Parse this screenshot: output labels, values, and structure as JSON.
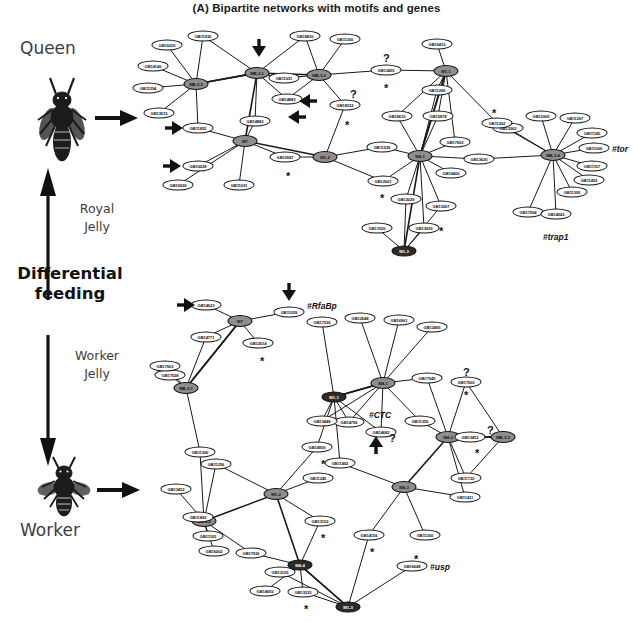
{
  "figure": {
    "title": "(A) Bipartite networks with motifs and genes",
    "left_labels": {
      "queen": "Queen",
      "worker": "Worker",
      "royal_jelly": "Royal\nJelly",
      "royal_jelly_line1": "Royal",
      "royal_jelly_line2": "Jelly",
      "worker_jelly_line1": "Worker",
      "worker_jelly_line2": "Jelly",
      "differential_feeding_line1": "Differential",
      "differential_feeding_line2": "feeding"
    },
    "symbols": {
      "question": "?",
      "star": "*",
      "hash": "#"
    },
    "colors": {
      "motif_fill": "#8e8e8e",
      "motif_dark_fill": "#2b2b2b",
      "gene_fill": "#ffffff",
      "stroke": "#111111",
      "label_gray": "#3d3d3d"
    }
  },
  "queen_network": {
    "name": "Queen bipartite network",
    "motifs": [
      {
        "id": "qm1",
        "label": "MB-3-2",
        "x": 196,
        "y": 84,
        "kind": "motif"
      },
      {
        "id": "qm2",
        "label": "MB-3-1",
        "x": 257,
        "y": 73,
        "kind": "motif"
      },
      {
        "id": "qm3",
        "label": "M7",
        "x": 245,
        "y": 141,
        "kind": "motif"
      },
      {
        "id": "qm4",
        "label": "MB-3-3",
        "x": 319,
        "y": 75,
        "kind": "motif"
      },
      {
        "id": "qm5",
        "label": "M1-1",
        "x": 446,
        "y": 71,
        "kind": "motif"
      },
      {
        "id": "qm6",
        "label": "M1-2",
        "x": 325,
        "y": 157,
        "kind": "motif"
      },
      {
        "id": "qm7",
        "label": "M4-1",
        "x": 420,
        "y": 156,
        "kind": "motif"
      },
      {
        "id": "qm8",
        "label": "MB-3-4",
        "x": 553,
        "y": 155,
        "kind": "motif"
      },
      {
        "id": "qm9",
        "label": "M1-3",
        "x": 404,
        "y": 251,
        "kind": "motif-dark"
      }
    ],
    "genes": [
      {
        "id": "qg1",
        "label": "GB11930",
        "x": 203,
        "y": 36
      },
      {
        "id": "qg2",
        "label": "GB16205",
        "x": 167,
        "y": 45
      },
      {
        "id": "qg3",
        "label": "GB14140",
        "x": 153,
        "y": 66
      },
      {
        "id": "qg4",
        "label": "GB11294",
        "x": 148,
        "y": 88
      },
      {
        "id": "qg5",
        "label": "GB13515",
        "x": 159,
        "y": 113
      },
      {
        "id": "qg6",
        "label": "GB11852",
        "x": 198,
        "y": 128
      },
      {
        "id": "qg7",
        "label": "GB10028",
        "x": 198,
        "y": 166
      },
      {
        "id": "qg8",
        "label": "GB16936",
        "x": 178,
        "y": 185
      },
      {
        "id": "qg9",
        "label": "GB11031",
        "x": 239,
        "y": 185
      },
      {
        "id": "qg10",
        "label": "GB11021",
        "x": 284,
        "y": 78
      },
      {
        "id": "qg11",
        "label": "GB14883",
        "x": 287,
        "y": 99
      },
      {
        "id": "qg12",
        "label": "GB14883",
        "x": 255,
        "y": 121
      },
      {
        "id": "qg13",
        "label": "GB18830",
        "x": 305,
        "y": 36
      },
      {
        "id": "qg14",
        "label": "GB11200",
        "x": 345,
        "y": 39
      },
      {
        "id": "qg15",
        "label": "GB13455",
        "x": 386,
        "y": 70
      },
      {
        "id": "qg16",
        "label": "GB18332",
        "x": 345,
        "y": 105
      },
      {
        "id": "qg17",
        "label": "GB10587",
        "x": 285,
        "y": 157
      },
      {
        "id": "qg18",
        "label": "GB16410",
        "x": 437,
        "y": 44
      },
      {
        "id": "qg19",
        "label": "GB11269",
        "x": 437,
        "y": 90
      },
      {
        "id": "qg20",
        "label": "GB18610",
        "x": 397,
        "y": 116
      },
      {
        "id": "qg21",
        "label": "GB15878",
        "x": 438,
        "y": 116
      },
      {
        "id": "qg22",
        "label": "GB11529",
        "x": 382,
        "y": 147
      },
      {
        "id": "qg23",
        "label": "GB12001",
        "x": 383,
        "y": 181
      },
      {
        "id": "qg24",
        "label": "GB17902",
        "x": 455,
        "y": 142
      },
      {
        "id": "qg25",
        "label": "GB19400",
        "x": 451,
        "y": 173
      },
      {
        "id": "qg26",
        "label": "GB13620",
        "x": 479,
        "y": 159
      },
      {
        "id": "qg27",
        "label": "GB13029",
        "x": 406,
        "y": 199
      },
      {
        "id": "qg28",
        "label": "GB13267",
        "x": 441,
        "y": 206
      },
      {
        "id": "qg29",
        "label": "GB17650",
        "x": 377,
        "y": 228
      },
      {
        "id": "qg30",
        "label": "GB13929",
        "x": 424,
        "y": 228
      },
      {
        "id": "qg31",
        "label": "GB13362",
        "x": 508,
        "y": 128
      },
      {
        "id": "qg32",
        "label": "GB12365",
        "x": 541,
        "y": 116
      },
      {
        "id": "qg33",
        "label": "GB11267",
        "x": 575,
        "y": 118
      },
      {
        "id": "qg34",
        "label": "GB11145",
        "x": 592,
        "y": 133
      },
      {
        "id": "qg35",
        "label": "GB11000",
        "x": 594,
        "y": 148,
        "annotation": "#tor"
      },
      {
        "id": "qg36",
        "label": "GB11157",
        "x": 592,
        "y": 166
      },
      {
        "id": "qg37",
        "label": "GB11403",
        "x": 589,
        "y": 180
      },
      {
        "id": "qg38",
        "label": "GB11393",
        "x": 572,
        "y": 192
      },
      {
        "id": "qg39",
        "label": "GB17994",
        "x": 528,
        "y": 212
      },
      {
        "id": "qg40",
        "label": "GB14543",
        "x": 556,
        "y": 214,
        "annotation": "#trap1"
      },
      {
        "id": "qg41",
        "label": "GB11262",
        "x": 497,
        "y": 123
      }
    ],
    "annotations": [
      {
        "text": "#tor",
        "x": 612,
        "y": 144
      },
      {
        "text": "#trap1",
        "x": 543,
        "y": 232
      }
    ],
    "question_marks": [
      {
        "x": 383,
        "y": 52
      },
      {
        "x": 350,
        "y": 88
      }
    ],
    "stars": [
      {
        "x": 384,
        "y": 85
      },
      {
        "x": 345,
        "y": 122
      },
      {
        "x": 286,
        "y": 173
      },
      {
        "x": 380,
        "y": 195
      },
      {
        "x": 492,
        "y": 110
      },
      {
        "x": 439,
        "y": 228
      }
    ],
    "arrows": [
      {
        "dir": "down",
        "x": 259,
        "y": 48
      },
      {
        "dir": "left",
        "x": 308,
        "y": 101
      },
      {
        "dir": "left",
        "x": 297,
        "y": 117
      },
      {
        "dir": "right",
        "x": 174,
        "y": 128
      },
      {
        "dir": "right",
        "x": 172,
        "y": 166
      }
    ]
  },
  "worker_network": {
    "name": "Worker bipartite network",
    "motifs": [
      {
        "id": "wm1",
        "label": "M7",
        "x": 240,
        "y": 321,
        "kind": "motif"
      },
      {
        "id": "wm2",
        "label": "MB-3-1",
        "x": 186,
        "y": 388,
        "kind": "motif"
      },
      {
        "id": "wm3",
        "label": "M4-1",
        "x": 383,
        "y": 383,
        "kind": "motif"
      },
      {
        "id": "wm4",
        "label": "M1-2",
        "x": 276,
        "y": 494,
        "kind": "motif"
      },
      {
        "id": "wm5",
        "label": "MB-3-2",
        "x": 204,
        "y": 521,
        "kind": "motif"
      },
      {
        "id": "wm6",
        "label": "M4-3",
        "x": 404,
        "y": 487,
        "kind": "motif"
      },
      {
        "id": "wm7",
        "label": "M4-2",
        "x": 448,
        "y": 437,
        "kind": "motif"
      },
      {
        "id": "wm8",
        "label": "MB-3-3",
        "x": 503,
        "y": 437,
        "kind": "motif"
      },
      {
        "id": "wm9",
        "label": "M1-1",
        "x": 334,
        "y": 397,
        "kind": "motif-dark"
      },
      {
        "id": "wm10",
        "label": "M1-3",
        "x": 348,
        "y": 607,
        "kind": "motif-dark"
      },
      {
        "id": "wm11",
        "label": "M4-4",
        "x": 300,
        "y": 565,
        "kind": "motif-dark"
      }
    ],
    "genes": [
      {
        "id": "wg1",
        "label": "GB14623",
        "x": 206,
        "y": 305
      },
      {
        "id": "wg2",
        "label": "GB14771",
        "x": 206,
        "y": 337
      },
      {
        "id": "wg3",
        "label": "GB11059",
        "x": 289,
        "y": 312,
        "annotation": "#RfaBp"
      },
      {
        "id": "wg4",
        "label": "GB12014",
        "x": 258,
        "y": 343
      },
      {
        "id": "wg5",
        "label": "GB17928",
        "x": 170,
        "y": 375
      },
      {
        "id": "wg6",
        "label": "GB17236",
        "x": 322,
        "y": 322
      },
      {
        "id": "wg7",
        "label": "GB12648",
        "x": 360,
        "y": 318
      },
      {
        "id": "wg8",
        "label": "GB16961",
        "x": 399,
        "y": 320
      },
      {
        "id": "wg9",
        "label": "GB12495",
        "x": 432,
        "y": 327
      },
      {
        "id": "wg10",
        "label": "GB17945",
        "x": 427,
        "y": 378
      },
      {
        "id": "wg11",
        "label": "GB17902",
        "x": 466,
        "y": 382
      },
      {
        "id": "wg12",
        "label": "GB14796",
        "x": 349,
        "y": 422,
        "annotation": "#CTC"
      },
      {
        "id": "wg13",
        "label": "GB14682",
        "x": 381,
        "y": 432
      },
      {
        "id": "wg14",
        "label": "GB11359",
        "x": 420,
        "y": 421
      },
      {
        "id": "wg15",
        "label": "GB13452",
        "x": 470,
        "y": 437
      },
      {
        "id": "wg16",
        "label": "GB11360",
        "x": 200,
        "y": 452
      },
      {
        "id": "wg17",
        "label": "GB11256",
        "x": 216,
        "y": 464
      },
      {
        "id": "wg18",
        "label": "GB13452",
        "x": 176,
        "y": 489
      },
      {
        "id": "wg19",
        "label": "GB11893",
        "x": 198,
        "y": 517
      },
      {
        "id": "wg20",
        "label": "GB11105",
        "x": 208,
        "y": 536
      },
      {
        "id": "wg21",
        "label": "GB16002",
        "x": 214,
        "y": 551
      },
      {
        "id": "wg22",
        "label": "GB17936",
        "x": 251,
        "y": 553
      },
      {
        "id": "wg23",
        "label": "GB13448",
        "x": 322,
        "y": 421
      },
      {
        "id": "wg24",
        "label": "GB14959",
        "x": 317,
        "y": 447
      },
      {
        "id": "wg25",
        "label": "GB11462",
        "x": 340,
        "y": 463
      },
      {
        "id": "wg26",
        "label": "GB11245",
        "x": 318,
        "y": 478
      },
      {
        "id": "wg27",
        "label": "GB13152",
        "x": 320,
        "y": 521
      },
      {
        "id": "wg28",
        "label": "GB14156",
        "x": 369,
        "y": 535
      },
      {
        "id": "wg29",
        "label": "GB11722",
        "x": 466,
        "y": 478
      },
      {
        "id": "wg30",
        "label": "GB11411",
        "x": 465,
        "y": 497
      },
      {
        "id": "wg31",
        "label": "GB11200",
        "x": 425,
        "y": 535
      },
      {
        "id": "wg32",
        "label": "GB16648",
        "x": 412,
        "y": 566,
        "annotation": "#usp"
      },
      {
        "id": "wg33",
        "label": "GB13105",
        "x": 280,
        "y": 572
      },
      {
        "id": "wg34",
        "label": "GB14693",
        "x": 265,
        "y": 591
      },
      {
        "id": "wg35",
        "label": "GB13335",
        "x": 303,
        "y": 592
      },
      {
        "id": "wg36",
        "label": "GB17903",
        "x": 165,
        "y": 366
      }
    ],
    "annotations": [
      {
        "text": "#RfaBp",
        "x": 307,
        "y": 301
      },
      {
        "text": "#CTC",
        "x": 369,
        "y": 410
      },
      {
        "text": "#usp",
        "x": 430,
        "y": 562
      }
    ],
    "question_marks": [
      {
        "x": 463,
        "y": 366
      },
      {
        "x": 487,
        "y": 424
      },
      {
        "x": 389,
        "y": 432
      }
    ],
    "stars": [
      {
        "x": 260,
        "y": 358
      },
      {
        "x": 464,
        "y": 392
      },
      {
        "x": 475,
        "y": 450
      },
      {
        "x": 321,
        "y": 461
      },
      {
        "x": 321,
        "y": 535
      },
      {
        "x": 370,
        "y": 549
      },
      {
        "x": 414,
        "y": 556
      },
      {
        "x": 304,
        "y": 606
      }
    ],
    "arrows": [
      {
        "dir": "down",
        "x": 289,
        "y": 292
      },
      {
        "dir": "right",
        "x": 186,
        "y": 305
      },
      {
        "dir": "up",
        "x": 376,
        "y": 445
      }
    ]
  }
}
